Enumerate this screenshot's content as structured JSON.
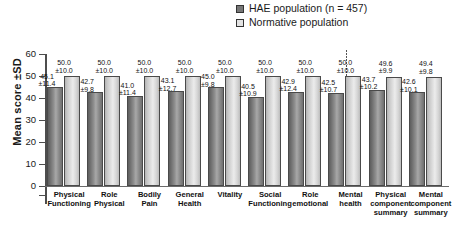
{
  "legend": {
    "position": "top-right",
    "items": [
      {
        "label": "HAE population (n = 457)",
        "swatch": "filled-dark-square",
        "color": "#777777"
      },
      {
        "label": "Normative population",
        "swatch": "open-light-square",
        "color": "#e3e3e3"
      }
    ]
  },
  "axis": {
    "ylabel": "Mean score ±SD",
    "yticks": [
      "0",
      "10",
      "20",
      "30",
      "40",
      "50",
      "60"
    ]
  },
  "chart_data": {
    "type": "bar",
    "title": "",
    "xlabel": "",
    "ylabel": "Mean score ±SD",
    "ylim": [
      0,
      60
    ],
    "ytick_step": 10,
    "grid": false,
    "legend_position": "top-right",
    "divider_after_category_index": 7,
    "categories": [
      "Physical Functioning",
      "Role Physical",
      "Bodily Pain",
      "General Health",
      "Vitality",
      "Social Functioning",
      "Role emotional",
      "Mental health",
      "Physical component summary",
      "Mental component summary"
    ],
    "category_lines": [
      [
        "Physical",
        "Functioning"
      ],
      [
        "Role",
        "Physical"
      ],
      [
        "Bodily",
        "Pain"
      ],
      [
        "General",
        "Health"
      ],
      [
        "Vitality"
      ],
      [
        "Social",
        "Functioning"
      ],
      [
        "Role",
        "emotional"
      ],
      [
        "Mental",
        "health"
      ],
      [
        "Physical",
        "component",
        "summary"
      ],
      [
        "Mental",
        "component",
        "summary"
      ]
    ],
    "series": [
      {
        "name": "HAE population (n = 457)",
        "color": "#8a8a8a",
        "values": [
          45.1,
          42.7,
          41.0,
          43.1,
          45.0,
          40.5,
          42.9,
          42.5,
          43.7,
          42.6
        ],
        "sd": [
          11.4,
          9.8,
          11.4,
          12.7,
          9.8,
          10.9,
          12.4,
          10.7,
          10.2,
          10.1
        ],
        "labels": [
          {
            "mean": "45.1",
            "sd": "±11.4"
          },
          {
            "mean": "42.7",
            "sd": "±9.8"
          },
          {
            "mean": "41.0",
            "sd": "±11.4"
          },
          {
            "mean": "43.1",
            "sd": "±12.7"
          },
          {
            "mean": "45.0",
            "sd": "±9.8"
          },
          {
            "mean": "40.5",
            "sd": "±10.9"
          },
          {
            "mean": "42.9",
            "sd": "±12.4"
          },
          {
            "mean": "42.5",
            "sd": "±10.7"
          },
          {
            "mean": "43.7",
            "sd": "±10.2"
          },
          {
            "mean": "42.6",
            "sd": "±10.1"
          }
        ]
      },
      {
        "name": "Normative population",
        "color": "#dcdcdc",
        "values": [
          50.0,
          50.0,
          50.0,
          50.0,
          50.0,
          50.0,
          50.0,
          50.0,
          49.6,
          49.4
        ],
        "sd": [
          10.0,
          10.0,
          10.0,
          10.0,
          10.0,
          10.0,
          10.0,
          10.0,
          9.9,
          9.8
        ],
        "labels": [
          {
            "mean": "50.0",
            "sd": "±10.0"
          },
          {
            "mean": "50.0",
            "sd": "±10.0"
          },
          {
            "mean": "50.0",
            "sd": "±10.0"
          },
          {
            "mean": "50.0",
            "sd": "±10.0"
          },
          {
            "mean": "50.0",
            "sd": "±10.0"
          },
          {
            "mean": "50.0",
            "sd": "±10.0"
          },
          {
            "mean": "50.0",
            "sd": "±10.0"
          },
          {
            "mean": "50.0",
            "sd": "±10.0"
          },
          {
            "mean": "49.6",
            "sd": "±9.9"
          },
          {
            "mean": "49.4",
            "sd": "±9.8"
          }
        ]
      }
    ]
  }
}
